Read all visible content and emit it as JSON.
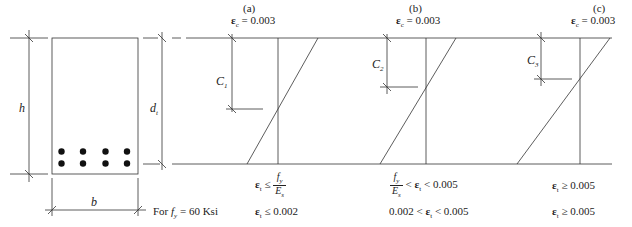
{
  "figure": {
    "section": {
      "height_label": "h",
      "width_label": "b",
      "depth_label": "d",
      "depth_subscript": "t",
      "bar_rows": 2,
      "bar_cols": 4
    },
    "cases": [
      {
        "id": "a",
        "label": "(a)",
        "top_strain": "= 0.003",
        "c_label": "C",
        "c_subscript": "1",
        "cond1_lhs": "≤",
        "cond1_num": "f",
        "cond1_num_sub": "y",
        "cond1_den": "E",
        "cond1_den_sub": "s",
        "cond2": "≤ 0.002"
      },
      {
        "id": "b",
        "label": "(b)",
        "top_strain": "= 0.003",
        "c_label": "C",
        "c_subscript": "2",
        "cond1_num": "f",
        "cond1_num_sub": "y",
        "cond1_den": "E",
        "cond1_den_sub": "s",
        "cond1_mid": "<",
        "cond1_rhs": "< 0.005",
        "cond2_lhs": "0.002 <",
        "cond2_rhs": "< 0.005"
      },
      {
        "id": "c",
        "label": "(c)",
        "top_strain": "= 0.003",
        "c_label": "C",
        "c_subscript": "3",
        "cond1": "≥ 0.005",
        "cond2": "≥ 0.005"
      }
    ],
    "strain_symbol": "ε",
    "concrete_sub": "c",
    "steel_sub": "t",
    "fy_row_label_prefix": "For ",
    "fy_symbol": "f",
    "fy_sub": "y",
    "fy_value": " = 60 Ksi"
  }
}
